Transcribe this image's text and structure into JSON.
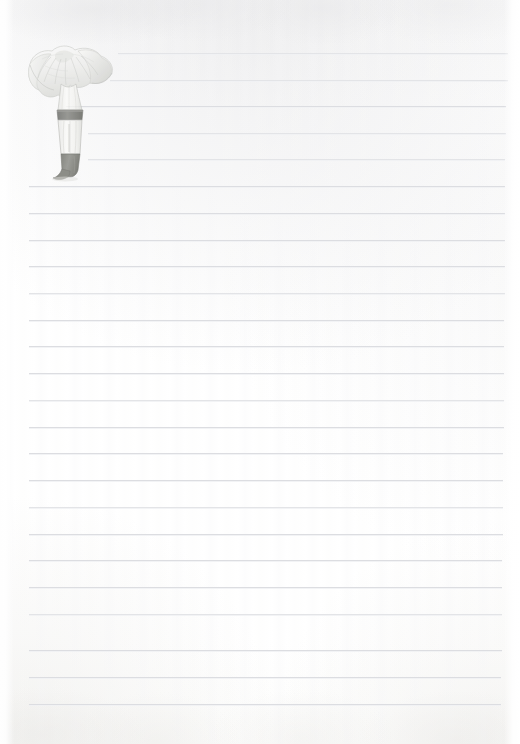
{
  "document": {
    "kind": "scanned-lined-notepaper",
    "title": "Blank lined notebook page with mushroom illustration",
    "page_width": 520,
    "page_height": 744,
    "orientation": "portrait",
    "text_content": "",
    "is_blank": "true"
  },
  "paper": {
    "background_color": "#fefefe",
    "paper_tint_color": "#fbfbfb",
    "edge_color": "#ffffff",
    "scan_smudge_color": "#e4e4e6"
  },
  "rules": {
    "line_color": "#dcdde1",
    "line_color_soft": "#e3e4e7",
    "line_color_softer": "#e9eaec",
    "line_thickness": 1,
    "spacing": 26.6,
    "first_line_y": 53,
    "left_margin_x": 28,
    "right_margin_x": 505,
    "count": 25,
    "lines": [
      {
        "y": 53,
        "x1": 118,
        "x2": 508,
        "tone": "soft"
      },
      {
        "y": 80,
        "x1": 110,
        "x2": 508,
        "tone": "soft"
      },
      {
        "y": 106,
        "x1": 66,
        "x2": 506,
        "tone": "normal"
      },
      {
        "y": 133,
        "x1": 88,
        "x2": 506,
        "tone": "soft"
      },
      {
        "y": 159,
        "x1": 88,
        "x2": 505,
        "tone": "soft"
      },
      {
        "y": 186,
        "x1": 29,
        "x2": 505,
        "tone": "normal"
      },
      {
        "y": 213,
        "x1": 29,
        "x2": 505,
        "tone": "normal"
      },
      {
        "y": 240,
        "x1": 29,
        "x2": 505,
        "tone": "normal"
      },
      {
        "y": 266,
        "x1": 29,
        "x2": 505,
        "tone": "normal"
      },
      {
        "y": 293,
        "x1": 29,
        "x2": 505,
        "tone": "soft"
      },
      {
        "y": 320,
        "x1": 29,
        "x2": 504,
        "tone": "normal"
      },
      {
        "y": 346,
        "x1": 29,
        "x2": 504,
        "tone": "normal"
      },
      {
        "y": 373,
        "x1": 29,
        "x2": 504,
        "tone": "normal"
      },
      {
        "y": 400,
        "x1": 29,
        "x2": 504,
        "tone": "soft"
      },
      {
        "y": 427,
        "x1": 29,
        "x2": 504,
        "tone": "normal"
      },
      {
        "y": 453,
        "x1": 29,
        "x2": 503,
        "tone": "normal"
      },
      {
        "y": 480,
        "x1": 29,
        "x2": 503,
        "tone": "normal"
      },
      {
        "y": 507,
        "x1": 29,
        "x2": 503,
        "tone": "soft"
      },
      {
        "y": 534,
        "x1": 29,
        "x2": 503,
        "tone": "normal"
      },
      {
        "y": 560,
        "x1": 29,
        "x2": 502,
        "tone": "normal"
      },
      {
        "y": 587,
        "x1": 29,
        "x2": 502,
        "tone": "normal"
      },
      {
        "y": 614,
        "x1": 29,
        "x2": 502,
        "tone": "soft"
      },
      {
        "y": 650,
        "x1": 29,
        "x2": 502,
        "tone": "normal"
      },
      {
        "y": 677,
        "x1": 29,
        "x2": 501,
        "tone": "normal"
      },
      {
        "y": 704,
        "x1": 29,
        "x2": 501,
        "tone": "normal"
      }
    ]
  },
  "illustration": {
    "name": "mushroom-illustration",
    "subject": "mushroom",
    "style": "faded pencil and watercolor botanical sketch",
    "position": {
      "x": 12,
      "y": 28,
      "width": 112,
      "height": 155
    },
    "cap_color": "#e8e8e6",
    "cap_shade_color": "#cfd0cd",
    "gill_color": "#bfc0bd",
    "stem_color": "#f2f2f0",
    "stem_outline_color": "#a9aaa6",
    "ring_color": "#6e6f6b",
    "base_color": "#76776f",
    "opacity": "0.85"
  }
}
